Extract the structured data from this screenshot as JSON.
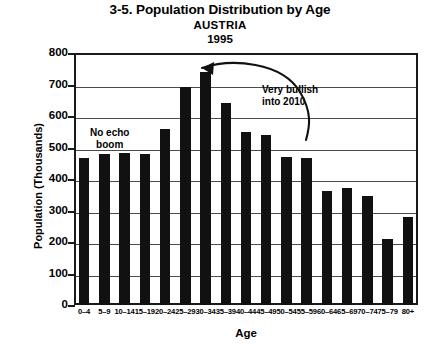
{
  "chart_data": {
    "type": "bar",
    "title": "3-5. Population Distribution by Age",
    "subtitle": "AUSTRIA",
    "year": "1995",
    "xlabel": "Age",
    "ylabel": "Population (Thousands)",
    "ylim": [
      0,
      800
    ],
    "ytick_step": 100,
    "grid": true,
    "legend": "none",
    "bar_color": "#111111",
    "categories": [
      "0–4",
      "5–9",
      "10–14",
      "15–19",
      "20–24",
      "25–29",
      "30–34",
      "35–39",
      "40–44",
      "45–49",
      "50–54",
      "55–59",
      "60–64",
      "65–69",
      "70–74",
      "75–79",
      "80+"
    ],
    "values": [
      467,
      478,
      484,
      480,
      558,
      693,
      740,
      640,
      548,
      540,
      470,
      468,
      362,
      370,
      347,
      210,
      280
    ],
    "yticks": [
      "0",
      "100",
      "200",
      "300",
      "400",
      "500",
      "600",
      "700",
      "800"
    ],
    "annotations": [
      {
        "text": "No echo\nboom",
        "name": "annotation-no-echo-boom"
      },
      {
        "text": "Very bullish\ninto 2010",
        "name": "annotation-very-bullish"
      }
    ]
  },
  "titles": {
    "main": "3-5. Population Distribution by Age",
    "sub": "AUSTRIA",
    "year": "1995"
  },
  "axes": {
    "x_title": "Age",
    "y_title": "Population (Thousands)"
  },
  "annotations": {
    "echo_line1": "No echo",
    "echo_line2": "boom",
    "bullish_line1": "Very bullish",
    "bullish_line2": "into 2010"
  }
}
